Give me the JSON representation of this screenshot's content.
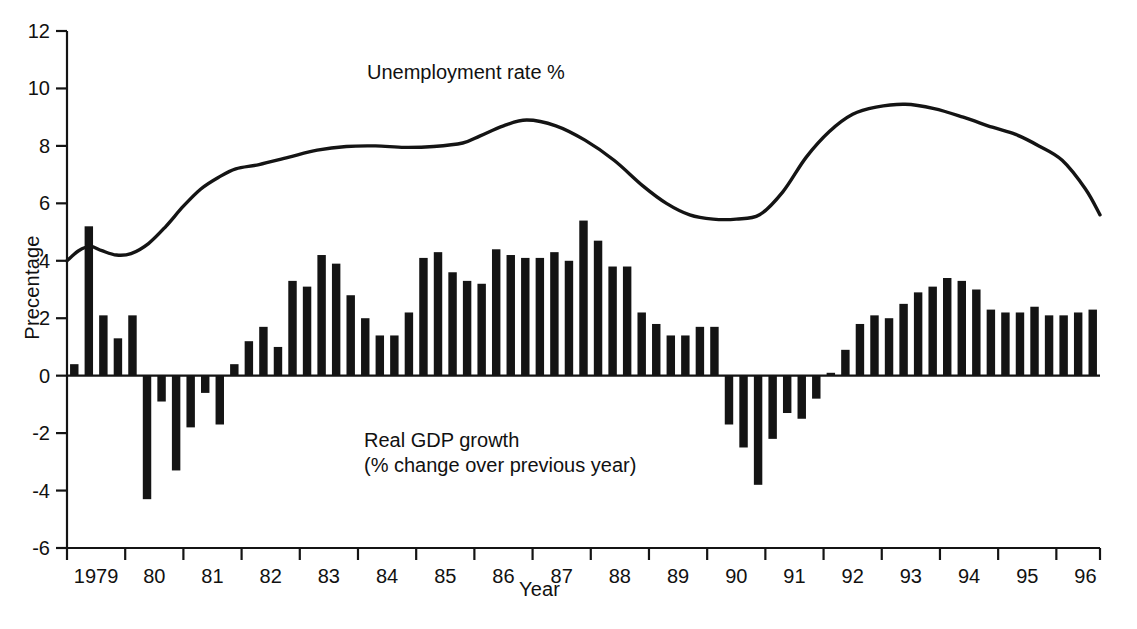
{
  "chart_data": {
    "type": "bar",
    "title": "",
    "subtitle": "",
    "xlabel": "Year",
    "ylabel": "Precentage",
    "ylim": [
      -6,
      12
    ],
    "ytick_values": [
      -6,
      -4,
      -2,
      0,
      2,
      4,
      6,
      8,
      10,
      12
    ],
    "ytick_labels": [
      "-6",
      "-4",
      "-2",
      "0",
      "2",
      "4",
      "6",
      "8",
      "10",
      "12"
    ],
    "xlim": [
      1979.0,
      1996.75
    ],
    "xtick_labels": [
      "1979",
      "80",
      "81",
      "82",
      "83",
      "84",
      "85",
      "86",
      "87",
      "88",
      "89",
      "90",
      "91",
      "92",
      "93",
      "94",
      "95",
      "96"
    ],
    "xtick_years": [
      1979,
      1980,
      1981,
      1982,
      1983,
      1984,
      1985,
      1986,
      1987,
      1988,
      1989,
      1990,
      1991,
      1992,
      1993,
      1994,
      1995,
      1996
    ],
    "grid": false,
    "legend_position": "inline-annotations",
    "series": [
      {
        "name": "Real GDP growth",
        "label_lines": [
          "Real GDP growth",
          "(% change over previous year)"
        ],
        "type": "bar",
        "frequency": "quarterly",
        "color": "#141414",
        "x": [
          1979.0,
          1979.25,
          1979.5,
          1979.75,
          1980.0,
          1980.25,
          1980.5,
          1980.75,
          1981.0,
          1981.25,
          1981.5,
          1981.75,
          1982.0,
          1982.25,
          1982.5,
          1982.75,
          1983.0,
          1983.25,
          1983.5,
          1983.75,
          1984.0,
          1984.25,
          1984.5,
          1984.75,
          1985.0,
          1985.25,
          1985.5,
          1985.75,
          1986.0,
          1986.25,
          1986.5,
          1986.75,
          1987.0,
          1987.25,
          1987.5,
          1987.75,
          1988.0,
          1988.25,
          1988.5,
          1988.75,
          1989.0,
          1989.25,
          1989.5,
          1989.75,
          1990.0,
          1990.25,
          1990.5,
          1990.75,
          1991.0,
          1991.25,
          1991.5,
          1991.75,
          1992.0,
          1992.25,
          1992.5,
          1992.75,
          1993.0,
          1993.25,
          1993.5,
          1993.75,
          1994.0,
          1994.25,
          1994.5,
          1994.75,
          1995.0,
          1995.25,
          1995.5,
          1995.75,
          1996.0,
          1996.25,
          1996.5
        ],
        "values": [
          0.4,
          5.2,
          2.1,
          1.3,
          2.1,
          -4.3,
          -0.9,
          -3.3,
          -1.8,
          -0.6,
          -1.7,
          0.4,
          1.2,
          1.7,
          1.0,
          3.3,
          3.1,
          4.2,
          3.9,
          2.8,
          2.0,
          1.4,
          1.4,
          2.2,
          4.1,
          4.3,
          3.6,
          3.3,
          3.2,
          4.4,
          4.2,
          4.1,
          4.1,
          4.3,
          4.0,
          5.4,
          4.7,
          3.8,
          3.8,
          2.2,
          1.8,
          1.4,
          1.4,
          1.7,
          1.7,
          -1.7,
          -2.5,
          -3.8,
          -2.2,
          -1.3,
          -1.5,
          -0.8,
          0.1,
          0.9,
          1.8,
          2.1,
          2.0,
          2.5,
          2.9,
          3.1,
          3.4,
          3.3,
          3.0,
          2.3,
          2.2,
          2.2,
          2.4,
          2.1,
          2.1,
          2.2,
          2.3
        ]
      },
      {
        "name": "Unemployment rate %",
        "label_lines": [
          "Unemployment rate %"
        ],
        "type": "line",
        "color": "#141414",
        "x": [
          1979.0,
          1979.2,
          1979.4,
          1979.6,
          1979.85,
          1980.1,
          1980.4,
          1980.7,
          1981.0,
          1981.3,
          1981.6,
          1981.9,
          1982.3,
          1982.8,
          1983.3,
          1983.8,
          1984.3,
          1984.8,
          1985.3,
          1985.8,
          1986.1,
          1986.5,
          1986.9,
          1987.4,
          1987.9,
          1988.4,
          1988.9,
          1989.3,
          1989.7,
          1990.1,
          1990.5,
          1990.9,
          1991.3,
          1991.7,
          1992.1,
          1992.5,
          1992.9,
          1993.4,
          1993.9,
          1994.4,
          1994.9,
          1995.3,
          1995.7,
          1996.1,
          1996.5,
          1996.75
        ],
        "values": [
          4.0,
          4.35,
          4.5,
          4.35,
          4.2,
          4.25,
          4.6,
          5.2,
          5.9,
          6.5,
          6.9,
          7.2,
          7.35,
          7.6,
          7.85,
          7.98,
          8.0,
          7.95,
          7.98,
          8.1,
          8.35,
          8.7,
          8.9,
          8.7,
          8.2,
          7.5,
          6.6,
          6.0,
          5.6,
          5.45,
          5.45,
          5.6,
          6.4,
          7.6,
          8.5,
          9.1,
          9.35,
          9.45,
          9.3,
          9.0,
          8.65,
          8.4,
          8.0,
          7.5,
          6.5,
          5.6
        ]
      }
    ],
    "annotations": [
      {
        "text": "Unemployment rate %",
        "x": 1985.3,
        "y": 10.6
      },
      {
        "text": "Real GDP growth",
        "x": 1983.3,
        "y": -2.4
      },
      {
        "text": "(% change over previous year)",
        "x": 1983.3,
        "y": -3.1
      }
    ]
  },
  "labels": {
    "y_axis": "Precentage",
    "x_axis": "Year",
    "unemployment": "Unemployment rate %",
    "gdp_line1": "Real GDP growth",
    "gdp_line2": "(% change over previous year)"
  },
  "colors": {
    "ink": "#141414",
    "background": "#ffffff"
  }
}
